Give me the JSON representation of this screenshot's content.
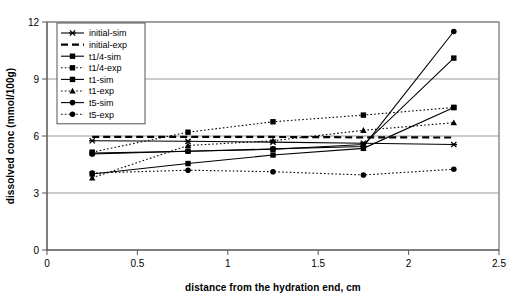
{
  "chart_data": {
    "type": "line",
    "title": "",
    "xlabel": "distance from the hydration end, cm",
    "ylabel": "dissolved conc (mmol/100g)",
    "xlim": [
      0,
      2.5
    ],
    "ylim": [
      0,
      12
    ],
    "xticks": [
      "0",
      "0.5",
      "1",
      "1.5",
      "2",
      "2.5"
    ],
    "xtick_values": [
      0,
      0.5,
      1,
      1.5,
      2,
      2.5
    ],
    "yticks": [
      "0",
      "3",
      "6",
      "9",
      "12"
    ],
    "ytick_values": [
      0,
      3,
      6,
      9,
      12
    ],
    "grid": "horizontal",
    "legend_position": "upper-left-inside",
    "x": [
      0.25,
      0.78,
      1.25,
      1.75,
      2.25
    ],
    "series": [
      {
        "name": "initial-sim",
        "marker": "x",
        "line": "solid",
        "values": [
          5.75,
          5.72,
          5.68,
          5.62,
          5.55
        ]
      },
      {
        "name": "initial-exp",
        "marker": "none",
        "line": "dashed",
        "values": [
          5.95,
          5.95,
          5.95,
          5.93,
          5.92
        ]
      },
      {
        "name": "t1/4-sim",
        "marker": "square",
        "line": "solid",
        "values": [
          5.1,
          5.2,
          5.3,
          5.55,
          10.1
        ]
      },
      {
        "name": "t1/4-exp",
        "marker": "square",
        "line": "dotted",
        "values": [
          5.15,
          6.2,
          6.75,
          7.1,
          7.5
        ]
      },
      {
        "name": "t1-sim",
        "marker": "square",
        "line": "solid",
        "values": [
          4.0,
          4.55,
          5.0,
          5.35,
          7.5
        ]
      },
      {
        "name": "t1-exp",
        "marker": "triangle",
        "line": "dotted",
        "values": [
          3.8,
          5.5,
          5.75,
          6.3,
          6.7
        ]
      },
      {
        "name": "t5-sim",
        "marker": "circle",
        "line": "solid",
        "values": [
          5.05,
          5.2,
          5.32,
          5.45,
          11.5
        ]
      },
      {
        "name": "t5-exp",
        "marker": "circle",
        "line": "dotted",
        "values": [
          4.05,
          4.2,
          4.12,
          3.95,
          4.25
        ]
      }
    ]
  },
  "legend": {
    "items": [
      {
        "label": "initial-sim"
      },
      {
        "label": "initial-exp"
      },
      {
        "label": "t1/4-sim"
      },
      {
        "label": "t1/4-exp"
      },
      {
        "label": "t1-sim"
      },
      {
        "label": "t1-exp"
      },
      {
        "label": "t5-sim"
      },
      {
        "label": "t5-exp"
      }
    ]
  },
  "colors": {
    "series": "#000000",
    "grid": "#999999",
    "axis": "#555555",
    "background": "#ffffff"
  }
}
